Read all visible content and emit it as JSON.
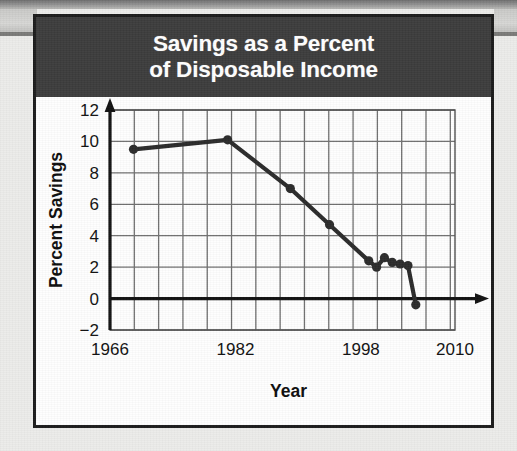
{
  "figure": {
    "title_line_1": "Savings as a Percent",
    "title_line_2": "of Disposable Income",
    "banner_color": "#3c3c3c",
    "banner_text_color": "#ffffff",
    "card_border_color": "#1b1b1b",
    "card_background": "#fefefe"
  },
  "chart_data": {
    "type": "line",
    "title": "Savings as a Percent of Disposable Income",
    "xlabel": "Year",
    "ylabel": "Percent Savings",
    "xlim": [
      1966,
      2010
    ],
    "ylim": [
      -2,
      12
    ],
    "grid": true,
    "legend": false,
    "x_tick_labels": [
      "1966",
      "1982",
      "1998",
      "2010"
    ],
    "x_tick_values": [
      1966,
      1982,
      1998,
      2010
    ],
    "y_tick_labels": [
      "12",
      "10",
      "8",
      "6",
      "4",
      "2",
      "0",
      "−2"
    ],
    "y_tick_values": [
      12,
      10,
      8,
      6,
      4,
      2,
      0,
      -2
    ],
    "x_gridline_step": 3.1,
    "y_gridline_step": 2,
    "line_color": "#2b2b2b",
    "marker_color": "#2b2b2b",
    "axis_color": "#111111",
    "grid_color": "#6f6f6f",
    "series": [
      {
        "name": "Percent Savings",
        "x": [
          1969,
          1981,
          1989,
          1994,
          1999,
          2000,
          2001,
          2002,
          2003,
          2004,
          2005
        ],
        "values": [
          9.5,
          10.1,
          7.0,
          4.7,
          2.4,
          2.0,
          2.6,
          2.3,
          2.2,
          2.1,
          -0.4
        ]
      }
    ]
  }
}
